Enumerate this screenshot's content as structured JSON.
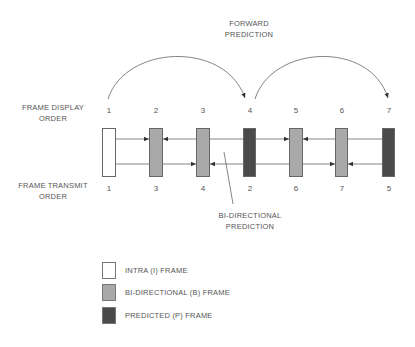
{
  "labels": {
    "forward_prediction": [
      "FORWARD",
      "PREDICTION"
    ],
    "display_order": [
      "FRAME  DISPLAY",
      "ORDER"
    ],
    "transmit_order": [
      "FRAME  TRANSMIT",
      "ORDER"
    ],
    "bidirectional_prediction": [
      "BI-DIRECTIONAL",
      "PREDICTION"
    ]
  },
  "colors": {
    "I": "#ffffff",
    "B": "#a9a9a9",
    "P": "#4a4a4a",
    "stroke": "#555555"
  },
  "frames": [
    {
      "type": "I",
      "display": "1",
      "transmit": "1",
      "x": 102
    },
    {
      "type": "B",
      "display": "2",
      "transmit": "3",
      "x": 149
    },
    {
      "type": "B",
      "display": "3",
      "transmit": "4",
      "x": 196
    },
    {
      "type": "P",
      "display": "4",
      "transmit": "2",
      "x": 243
    },
    {
      "type": "B",
      "display": "5",
      "transmit": "6",
      "x": 289
    },
    {
      "type": "B",
      "display": "6",
      "transmit": "7",
      "x": 335
    },
    {
      "type": "P",
      "display": "7",
      "transmit": "5",
      "x": 382
    }
  ],
  "legend": [
    {
      "type": "I",
      "label": "INTRA  (I)  FRAME"
    },
    {
      "type": "B",
      "label": "BI-DIRECTIONAL  (B)  FRAME"
    },
    {
      "type": "P",
      "label": "PREDICTED  (P)  FRAME"
    }
  ]
}
